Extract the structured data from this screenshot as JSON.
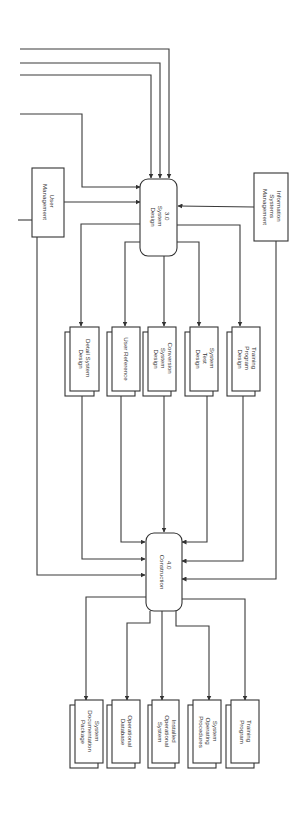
{
  "diagram": {
    "type": "data-flow-diagram",
    "orientation": "rotated-90",
    "processes": [
      {
        "id": "3.0",
        "number": "3.0",
        "lines": [
          "System",
          "Design"
        ]
      },
      {
        "id": "4.0",
        "number": "4.0",
        "lines": [
          "Construction"
        ]
      }
    ],
    "external_entities": [
      {
        "id": "user-mgmt",
        "lines": [
          "User",
          "Management"
        ]
      },
      {
        "id": "is-mgmt",
        "lines": [
          "Information",
          "Systems",
          "Management"
        ]
      }
    ],
    "design_outputs": [
      {
        "id": "detail-system-design",
        "lines": [
          "Detail System",
          "Design"
        ]
      },
      {
        "id": "user-reference",
        "lines": [
          "User Reference"
        ]
      },
      {
        "id": "conversion-system-design",
        "lines": [
          "Conversion",
          "System",
          "Design"
        ]
      },
      {
        "id": "system-test-design",
        "lines": [
          "System",
          "Test",
          "Design"
        ]
      },
      {
        "id": "training-program-design",
        "lines": [
          "Training",
          "Program",
          "Design"
        ]
      }
    ],
    "construction_outputs": [
      {
        "id": "system-documentation-package",
        "lines": [
          "System",
          "Documentation",
          "Package"
        ]
      },
      {
        "id": "operational-database",
        "lines": [
          "Operational",
          "Database"
        ]
      },
      {
        "id": "installed-operational-system",
        "lines": [
          "Installed",
          "Operational",
          "System"
        ]
      },
      {
        "id": "system-operating-procedures",
        "lines": [
          "System",
          "Operating",
          "Procedures"
        ]
      },
      {
        "id": "training-program",
        "lines": [
          "Training",
          "Program"
        ]
      }
    ]
  }
}
